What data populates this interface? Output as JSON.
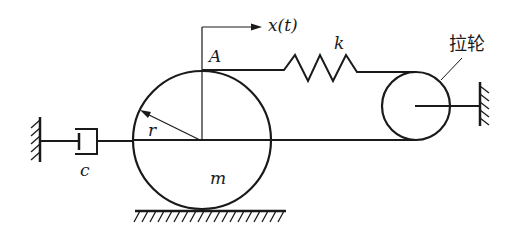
{
  "diagram": {
    "type": "mechanical vibration system",
    "labels": {
      "displacement": "x(t)",
      "point": "A",
      "spring": "k",
      "radius": "r",
      "damper": "c",
      "mass": "m",
      "pulley": "拉轮"
    },
    "colors": {
      "stroke": "#1a1a1a",
      "background": "#ffffff"
    }
  }
}
